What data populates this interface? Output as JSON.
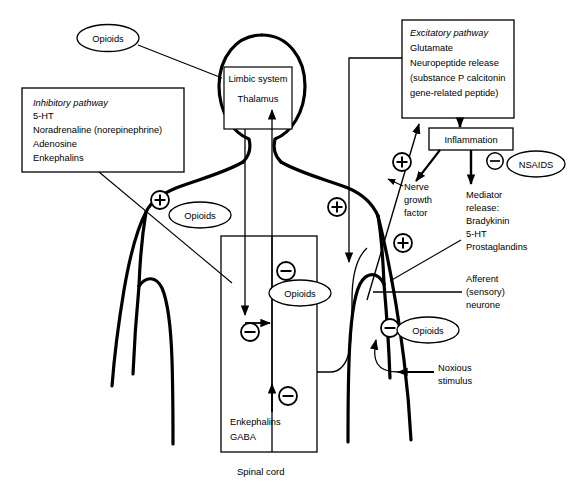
{
  "diagram": {
    "caption": "Spinal cord",
    "boxes": {
      "inhibitory": {
        "name": "Inhibitory pathway",
        "lines": [
          "Inhibitory pathway",
          "5-HT",
          "Noradrenaline (norepinephrine)",
          "Adenosine",
          "Enkephalins"
        ]
      },
      "brain": {
        "lines": [
          "Limbic system",
          "Thalamus"
        ]
      },
      "excitatory": {
        "name": "Excitatory pathway",
        "lines": [
          "Excitatory pathway",
          "Glutamate",
          "Neuropeptide release",
          "(substance P calcitonin",
          "gene-related peptide)"
        ]
      },
      "inflammation": {
        "label": "Inflammation"
      },
      "spinal": {
        "lines": [
          "Enkephalins",
          "GABA"
        ]
      }
    },
    "ellipses": {
      "opioids_top": "Opioids",
      "opioids_shoulder": "Opioids",
      "opioids_cord": "Opioids",
      "opioids_afferent": "Opioids",
      "nsaids": "NSAIDS"
    },
    "signs": {
      "plus": "+",
      "minus": "−"
    },
    "annotations": {
      "nerve_growth_factor": [
        "Nerve",
        "growth",
        "factor"
      ],
      "mediator_release": [
        "Mediator",
        "release:",
        "Bradykinin",
        "5-HT",
        "Prostaglandins"
      ],
      "afferent_neurone": [
        "Afferent",
        "(sensory)",
        "neurone"
      ],
      "noxious_stimulus": [
        "Noxious",
        "stimulus"
      ]
    },
    "colors": {
      "ink": "#000000",
      "paper": "#ffffff"
    }
  }
}
